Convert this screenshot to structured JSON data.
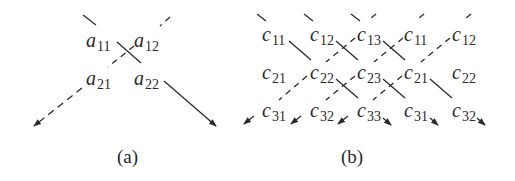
{
  "figure_a": {
    "caption": "(a)",
    "elements": [
      {
        "base": "a",
        "sub": "11",
        "x": 86,
        "y": 30
      },
      {
        "base": "a",
        "sub": "12",
        "x": 134,
        "y": 30
      },
      {
        "base": "a",
        "sub": "21",
        "x": 86,
        "y": 68
      },
      {
        "base": "a",
        "sub": "22",
        "x": 134,
        "y": 68
      }
    ],
    "arrows": [
      {
        "style": "solid",
        "direction": "down-right",
        "meaning": "product of main diagonal"
      },
      {
        "style": "dashed",
        "direction": "down-left",
        "meaning": "product of anti-diagonal"
      }
    ]
  },
  "figure_b": {
    "caption": "(b)",
    "rows": [
      [
        "c11",
        "c12",
        "c13",
        "c11",
        "c12"
      ],
      [
        "c21",
        "c22",
        "c23",
        "c21",
        "c22"
      ],
      [
        "c31",
        "c32",
        "c33",
        "c31",
        "c32"
      ]
    ],
    "elements": [
      {
        "base": "c",
        "sub": "11",
        "x": 262,
        "y": 24
      },
      {
        "base": "c",
        "sub": "12",
        "x": 310,
        "y": 24
      },
      {
        "base": "c",
        "sub": "13",
        "x": 357,
        "y": 24
      },
      {
        "base": "c",
        "sub": "11",
        "x": 404,
        "y": 24
      },
      {
        "base": "c",
        "sub": "12",
        "x": 452,
        "y": 24
      },
      {
        "base": "c",
        "sub": "21",
        "x": 262,
        "y": 62
      },
      {
        "base": "c",
        "sub": "22",
        "x": 310,
        "y": 62
      },
      {
        "base": "c",
        "sub": "23",
        "x": 357,
        "y": 62
      },
      {
        "base": "c",
        "sub": "21",
        "x": 404,
        "y": 62
      },
      {
        "base": "c",
        "sub": "22",
        "x": 452,
        "y": 62
      },
      {
        "base": "c",
        "sub": "31",
        "x": 262,
        "y": 100
      },
      {
        "base": "c",
        "sub": "32",
        "x": 310,
        "y": 100
      },
      {
        "base": "c",
        "sub": "33",
        "x": 357,
        "y": 100
      },
      {
        "base": "c",
        "sub": "31",
        "x": 404,
        "y": 100
      },
      {
        "base": "c",
        "sub": "32",
        "x": 452,
        "y": 100
      }
    ],
    "arrows": [
      {
        "style": "solid",
        "direction": "down-right",
        "path": [
          "c11",
          "c22",
          "c33"
        ]
      },
      {
        "style": "solid",
        "direction": "down-right",
        "path": [
          "c12",
          "c23",
          "c31"
        ]
      },
      {
        "style": "solid",
        "direction": "down-right",
        "path": [
          "c13",
          "c21",
          "c32"
        ]
      },
      {
        "style": "dashed",
        "direction": "down-left",
        "path": [
          "c13",
          "c22",
          "c31"
        ]
      },
      {
        "style": "dashed",
        "direction": "down-left",
        "path": [
          "c11",
          "c23",
          "c32"
        ]
      },
      {
        "style": "dashed",
        "direction": "down-left",
        "path": [
          "c12",
          "c21",
          "c33"
        ]
      }
    ]
  },
  "colors": {
    "ink": "#2a2a2a",
    "background": "#ffffff"
  }
}
